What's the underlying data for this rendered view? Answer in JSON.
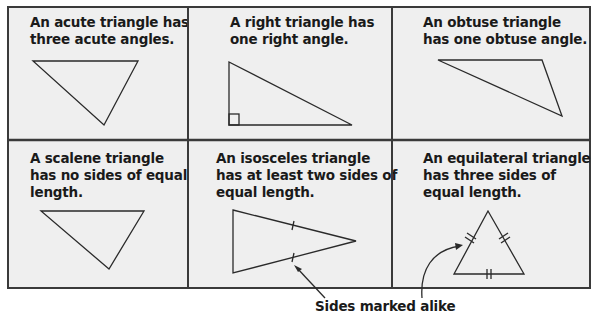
{
  "cells": [
    {
      "id": "acute",
      "text": "An acute triangle has\nthree acute angles."
    },
    {
      "id": "right",
      "text": "A right triangle has\none right angle."
    },
    {
      "id": "obtuse",
      "text": "An obtuse triangle\nhas one obtuse angle."
    },
    {
      "id": "scalene",
      "text": "A scalene triangle\nhas no sides of equal\nlength."
    },
    {
      "id": "isosceles",
      "text": "An isosceles triangle\nhas at least two sides of\nequal length."
    },
    {
      "id": "equilateral",
      "text": "An equilateral triangle\nhas three sides of\nequal length."
    }
  ],
  "caption": "Sides marked alike",
  "colors": {
    "background": "#efefef",
    "border": "#3a3a3a",
    "stroke": "#2a2a2a"
  }
}
